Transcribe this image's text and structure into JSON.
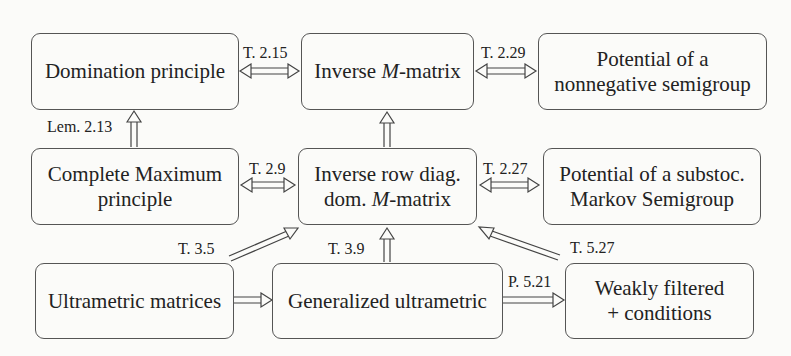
{
  "nodes": {
    "domination": {
      "line1": "Domination principle"
    },
    "inverse_m": {
      "pre": "Inverse ",
      "italic": "M",
      "post": "-matrix"
    },
    "potential_nonneg": {
      "line1": "Potential of a",
      "line2": "nonnegative semigroup"
    },
    "complete_max": {
      "line1": "Complete Maximum",
      "line2": "principle"
    },
    "inverse_row": {
      "line1": "Inverse row diag.",
      "pre2": "dom. ",
      "italic2": "M",
      "post2": "-matrix"
    },
    "potential_substoc": {
      "line1": "Potential of a substoc.",
      "line2": "Markov Semigroup"
    },
    "ultrametric": {
      "line1": "Ultrametric matrices"
    },
    "generalized": {
      "line1": "Generalized ultrametric"
    },
    "weakly": {
      "line1": "Weakly filtered",
      "line2": "+ conditions"
    }
  },
  "edges": {
    "dom_invm": "T. 2.15",
    "invm_potnn": "T. 2.29",
    "cmp_dom": "Lem. 2.13",
    "cmp_invrow": "T. 2.9",
    "invrow_potsub": "T. 2.27",
    "ultra_invrow": "T. 3.5",
    "gen_invrow": "T. 3.9",
    "weak_invrow": "T. 5.27",
    "gen_weak": "P. 5.21"
  }
}
